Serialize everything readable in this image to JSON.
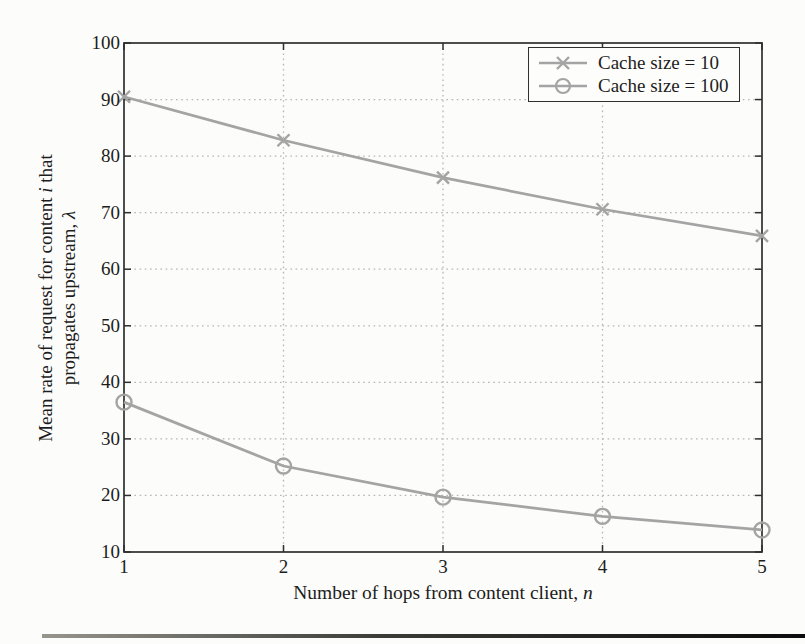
{
  "chart_data": {
    "type": "line",
    "title": "",
    "x": [
      1,
      2,
      3,
      4,
      5
    ],
    "series": [
      {
        "name": "Cache size = 10",
        "marker": "x",
        "values": [
          90.5,
          82.8,
          76.2,
          70.6,
          65.9
        ]
      },
      {
        "name": "Cache size = 100",
        "marker": "o",
        "values": [
          36.5,
          25.2,
          19.7,
          16.3,
          13.9
        ]
      }
    ],
    "xlabel": "Number of hops from content client, n",
    "ylabel": "Mean rate of request for content i that propagates upstream, λ",
    "xlim": [
      1,
      5
    ],
    "ylim": [
      10,
      100
    ],
    "x_ticks": [
      1,
      2,
      3,
      4,
      5
    ],
    "y_ticks": [
      10,
      20,
      30,
      40,
      50,
      60,
      70,
      80,
      90,
      100
    ],
    "grid": true,
    "legend_position": "top-right-inside"
  },
  "labels": {
    "ylabel_line1_pre": "Mean rate of request for content ",
    "ylabel_line1_italic": "i",
    "ylabel_line1_post": " that",
    "ylabel_line2_pre": "propagates upstream, ",
    "ylabel_line2_italic": "λ",
    "xlabel_pre": "Number of hops from content client, ",
    "xlabel_italic": "n"
  },
  "colors": {
    "series_line": "#a4a4a4",
    "grid_line": "#b6b6b6",
    "axis_line": "#2f2f2f",
    "text": "#1d1d1d",
    "page_background": "#fcfcfa",
    "legend_background": "#fdfdfc"
  }
}
